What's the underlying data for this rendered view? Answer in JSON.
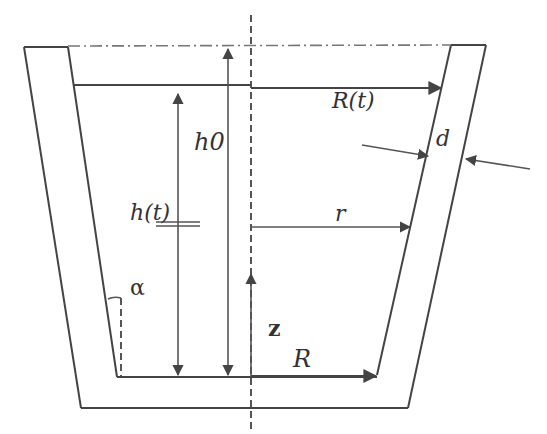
{
  "diagram": {
    "labels": {
      "h0": "h0",
      "h_t": "h(t)",
      "R_t": "R(t)",
      "r": "r",
      "R": "R",
      "z": "z",
      "d": "d",
      "alpha": "α"
    },
    "colors": {
      "line": "#444444",
      "text": "#333333",
      "background": "#ffffff"
    },
    "geometry": {
      "outer_wall": [
        [
          24,
          47
        ],
        [
          486,
          45
        ],
        [
          408,
          408
        ],
        [
          81,
          408
        ]
      ],
      "inner_wall": [
        [
          68,
          47
        ],
        [
          451,
          45
        ],
        [
          377,
          375
        ],
        [
          117,
          377
        ]
      ],
      "axis_x": 251,
      "liquid_level_y": 85,
      "rim_y": 46,
      "bottom_inner_y": 377
    }
  }
}
